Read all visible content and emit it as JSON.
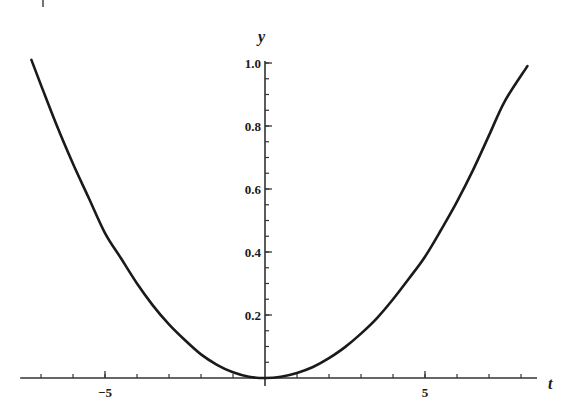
{
  "chart_data": {
    "type": "line",
    "title": "",
    "xlabel": "t",
    "ylabel": "y",
    "xlim": [
      -7.65,
      8.5
    ],
    "ylim": [
      0,
      1.0
    ],
    "grid": false,
    "legend": null,
    "x_major_ticks": [
      -5,
      5
    ],
    "x_major_tick_labels": [
      "−5",
      "5"
    ],
    "x_minor_ticks": [
      -7,
      -6,
      -5,
      -4,
      -3,
      -2,
      -1,
      1,
      2,
      3,
      4,
      5,
      6,
      7,
      8
    ],
    "y_major_ticks": [
      0.2,
      0.4,
      0.6,
      0.8,
      1.0
    ],
    "y_major_tick_labels": [
      "0.2",
      "0.4",
      "0.6",
      "0.8",
      "1.0"
    ],
    "y_minor_step": 0.05,
    "series": [
      {
        "name": "y(t)",
        "color": "#1a1a1a",
        "x": [
          -7.3,
          -7.0,
          -6.5,
          -6.0,
          -5.5,
          -5.0,
          -4.5,
          -4.0,
          -3.5,
          -3.0,
          -2.5,
          -2.0,
          -1.5,
          -1.0,
          -0.5,
          0.0,
          0.5,
          1.0,
          1.5,
          2.0,
          2.5,
          3.0,
          3.5,
          4.0,
          4.5,
          5.0,
          5.5,
          6.0,
          6.5,
          7.0,
          7.5,
          8.2
        ],
        "y": [
          1.01,
          0.93,
          0.8,
          0.68,
          0.57,
          0.46,
          0.38,
          0.3,
          0.23,
          0.17,
          0.12,
          0.075,
          0.042,
          0.018,
          0.004,
          0.0,
          0.004,
          0.016,
          0.035,
          0.063,
          0.098,
          0.141,
          0.19,
          0.25,
          0.316,
          0.385,
          0.47,
          0.56,
          0.66,
          0.77,
          0.88,
          0.99
        ]
      }
    ]
  }
}
